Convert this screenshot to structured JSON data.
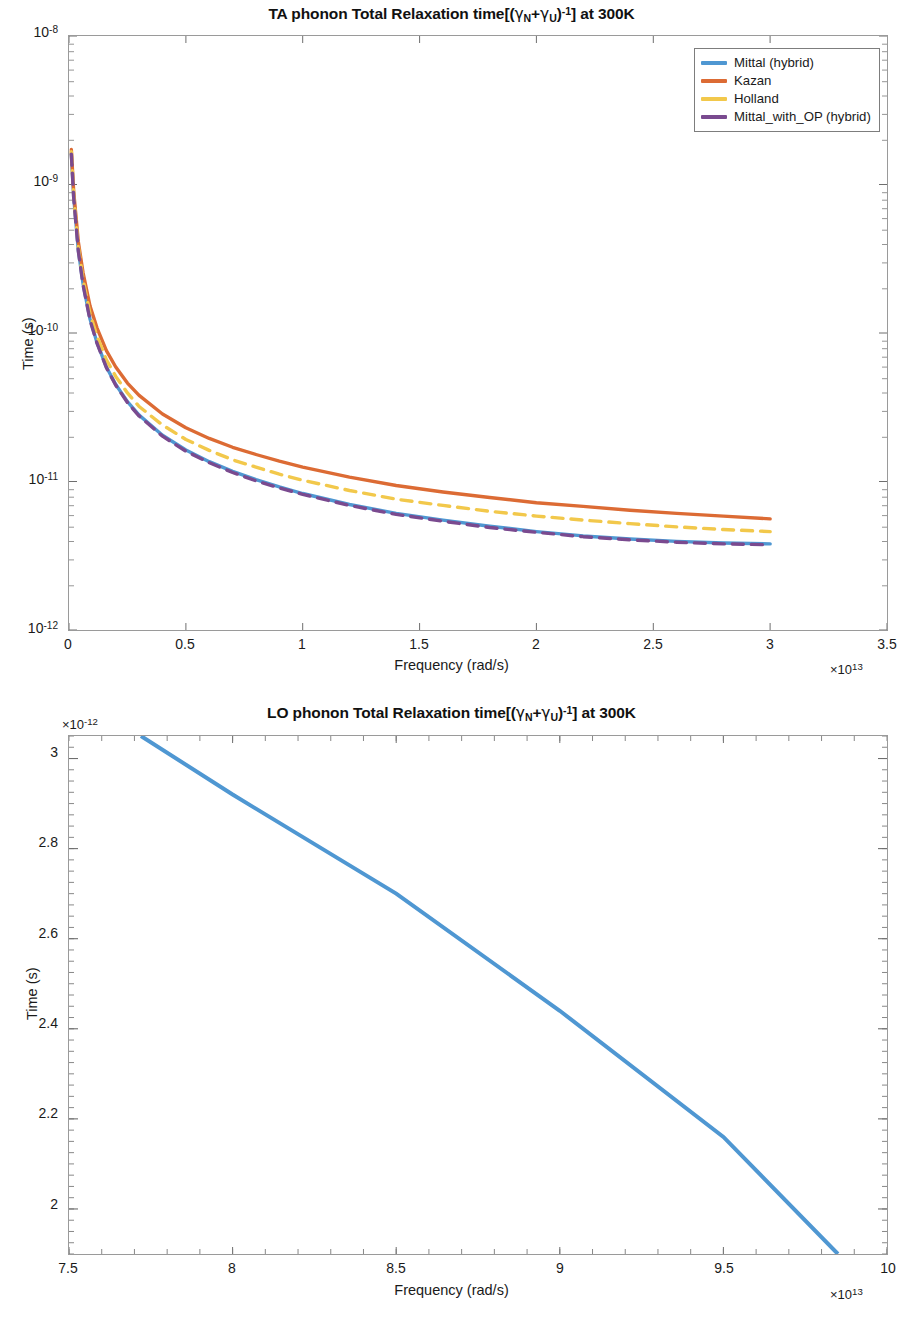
{
  "figures": [
    {
      "id": "ta-phonon-relaxation",
      "title_parts": {
        "prefix": "TA phonon Total Relaxation time[(",
        "gamma1": "γ",
        "sub1": "N",
        "plus": "+",
        "gamma2": "γ",
        "sub2": "U",
        "close": ")",
        "exp": "-1",
        "suffix": "] at 300K"
      },
      "title_plain": "TA phonon Total Relaxation time[(γN+γU)-1] at 300K",
      "legend": {
        "position": "top-right",
        "entries": [
          {
            "label": "Mittal (hybrid)",
            "color": "#4f97d2",
            "style": "solid"
          },
          {
            "label": "Kazan",
            "color": "#dc6b34",
            "style": "solid"
          },
          {
            "label": "Holland",
            "color": "#f2c84b",
            "style": "dashed"
          },
          {
            "label": "Mittal_with_OP (hybrid)",
            "color": "#7a4a8f",
            "style": "dashed"
          }
        ]
      },
      "xaxis": {
        "label": "Frequency (rad/s)",
        "ticks": [
          "0",
          "0.5",
          "1",
          "1.5",
          "2",
          "2.5",
          "3",
          "3.5"
        ],
        "multiplier_prefix": "×10",
        "multiplier_exp": "13",
        "min": 0,
        "max": 3.5
      },
      "yaxis": {
        "label": "Time (s)",
        "scale": "log",
        "ticks": [
          "10",
          "10",
          "10",
          "10",
          "10"
        ],
        "tick_exps": [
          "-12",
          "-11",
          "-10",
          "-9",
          "-8"
        ],
        "min": 1e-12,
        "max": 1e-08
      }
    },
    {
      "id": "lo-phonon-relaxation",
      "title_parts": {
        "prefix": "LO phonon Total Relaxation time[(",
        "gamma1": "γ",
        "sub1": "N",
        "plus": "+",
        "gamma2": "γ",
        "sub2": "U",
        "close": ")",
        "exp": "-1",
        "suffix": "] at 300K"
      },
      "title_plain": "LO phonon Total Relaxation time[(γN+γU)-1] at 300K",
      "xaxis": {
        "label": "Frequency (rad/s)",
        "ticks": [
          "7.5",
          "8",
          "8.5",
          "9",
          "9.5",
          "10"
        ],
        "multiplier_prefix": "×10",
        "multiplier_exp": "13",
        "min": 7.5,
        "max": 10
      },
      "yaxis": {
        "label": "Time (s)",
        "scale": "linear",
        "ticks": [
          "2",
          "2.2",
          "2.4",
          "2.6",
          "2.8",
          "3"
        ],
        "multiplier_prefix": "×10",
        "multiplier_exp": "-12",
        "min": 1.9,
        "max": 3.05
      }
    }
  ],
  "chart_data": [
    {
      "type": "line",
      "id": "ta-phonon-relaxation",
      "title": "TA phonon Total Relaxation time[(γN+γU)-1] at 300K",
      "xlabel": "Frequency (rad/s)",
      "ylabel": "Time (s)",
      "x_multiplier": 10000000000000.0,
      "xlim": [
        0,
        3.5
      ],
      "ylim": [
        1e-12,
        1e-08
      ],
      "yscale": "log",
      "xscale": "linear",
      "grid": false,
      "legend_position": "upper right",
      "x": [
        0.01,
        0.02,
        0.04,
        0.06,
        0.09,
        0.12,
        0.16,
        0.2,
        0.25,
        0.3,
        0.4,
        0.5,
        0.6,
        0.7,
        0.8,
        0.9,
        1.0,
        1.2,
        1.4,
        1.6,
        1.8,
        2.0,
        2.2,
        2.4,
        2.6,
        2.8,
        3.0
      ],
      "series": [
        {
          "name": "Mittal (hybrid)",
          "color": "#4f97d2",
          "style": "solid",
          "values": [
            1.62e-09,
            8.3e-10,
            3.6e-10,
            2.15e-10,
            1.24e-10,
            8.6e-11,
            5.9e-11,
            4.5e-11,
            3.45e-11,
            2.8e-11,
            2.05e-11,
            1.63e-11,
            1.36e-11,
            1.17e-11,
            1.03e-11,
            9.2e-12,
            8.3e-12,
            7e-12,
            6.1e-12,
            5.5e-12,
            5e-12,
            4.6e-12,
            4.3e-12,
            4.1e-12,
            3.95e-12,
            3.85e-12,
            3.8e-12
          ]
        },
        {
          "name": "Kazan",
          "color": "#dc6b34",
          "style": "solid",
          "values": [
            1.72e-09,
            9e-10,
            4.1e-10,
            2.55e-10,
            1.52e-10,
            1.08e-10,
            7.6e-11,
            5.9e-11,
            4.6e-11,
            3.8e-11,
            2.85e-11,
            2.3e-11,
            1.95e-11,
            1.7e-11,
            1.52e-11,
            1.37e-11,
            1.25e-11,
            1.07e-11,
            9.4e-12,
            8.5e-12,
            7.8e-12,
            7.2e-12,
            6.8e-12,
            6.4e-12,
            6.1e-12,
            5.85e-12,
            5.6e-12
          ]
        },
        {
          "name": "Holland",
          "color": "#f2c84b",
          "style": "dashed",
          "values": [
            1.66e-09,
            8.6e-10,
            3.8e-10,
            2.3e-10,
            1.35e-10,
            9.5e-11,
            6.6e-11,
            5.1e-11,
            3.95e-11,
            3.2e-11,
            2.4e-11,
            1.92e-11,
            1.62e-11,
            1.4e-11,
            1.25e-11,
            1.12e-11,
            1.02e-11,
            8.7e-12,
            7.6e-12,
            6.9e-12,
            6.3e-12,
            5.85e-12,
            5.5e-12,
            5.2e-12,
            4.95e-12,
            4.75e-12,
            4.6e-12
          ]
        },
        {
          "name": "Mittal_with_OP (hybrid)",
          "color": "#7a4a8f",
          "style": "dashed",
          "values": [
            1.6e-09,
            8.2e-10,
            3.55e-10,
            2.12e-10,
            1.22e-10,
            8.5e-11,
            5.85e-11,
            4.45e-11,
            3.4e-11,
            2.76e-11,
            2.02e-11,
            1.6e-11,
            1.34e-11,
            1.15e-11,
            1.01e-11,
            9.05e-12,
            8.2e-12,
            6.9e-12,
            6e-12,
            5.4e-12,
            4.9e-12,
            4.55e-12,
            4.25e-12,
            4.05e-12,
            3.9e-12,
            3.8e-12,
            3.75e-12
          ]
        }
      ]
    },
    {
      "type": "line",
      "id": "lo-phonon-relaxation",
      "title": "LO phonon Total Relaxation time[(γN+γU)-1] at 300K",
      "xlabel": "Frequency (rad/s)",
      "ylabel": "Time (s)",
      "x_multiplier": 10000000000000.0,
      "y_multiplier": 1e-12,
      "xlim": [
        7.5,
        10
      ],
      "ylim": [
        1.9,
        3.05
      ],
      "yscale": "linear",
      "xscale": "linear",
      "grid": false,
      "series": [
        {
          "name": "Mittal (hybrid)",
          "color": "#4f97d2",
          "style": "solid",
          "x": [
            7.72,
            8.0,
            8.5,
            9.0,
            9.5,
            9.85
          ],
          "values": [
            3.05,
            2.92,
            2.7,
            2.44,
            2.16,
            1.9
          ]
        }
      ]
    }
  ]
}
